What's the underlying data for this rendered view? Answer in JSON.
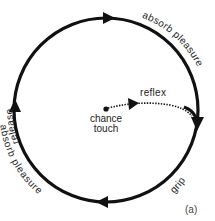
{
  "diagram": {
    "type": "cycle",
    "figure_label": "(a)",
    "colors": {
      "stroke": "#111111",
      "text": "#222222",
      "background": "#ffffff"
    },
    "center": {
      "label_line1": "chance",
      "label_line2": "touch"
    },
    "reflex": {
      "label": "reflex",
      "style": "dotted"
    },
    "arc_labels": {
      "top_left": "release",
      "top_right": "absorb pleasure",
      "bottom_right": "grip",
      "bottom_left": "absorb pleasure"
    },
    "direction": "clockwise",
    "arrows": [
      "top-pointing-right",
      "right-pointing-down",
      "bottom-pointing-left",
      "left-pointing-up"
    ]
  }
}
